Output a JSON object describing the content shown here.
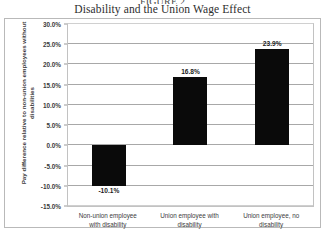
{
  "figure": {
    "caption_above": "FIGURE 2",
    "title": "Disability and the Union Wage Effect"
  },
  "chart_data": {
    "type": "bar",
    "title": "Disability and the Union Wage Effect",
    "xlabel": "",
    "ylabel": "Pay difference relative to non-union employees without disabilities",
    "categories": [
      "Non-union employee with disability",
      "Union employee with disability",
      "Union employee, no disability"
    ],
    "category_lines": [
      "Non-union employee\nwith disability",
      "Union employee with\ndisability",
      "Union employee, no\ndisability"
    ],
    "values": [
      -10.1,
      16.8,
      23.9
    ],
    "value_labels": [
      "-10.1%",
      "16.8%",
      "23.9%"
    ],
    "ylim": [
      -15.0,
      30.0
    ],
    "ytick_values": [
      30.0,
      25.0,
      20.0,
      15.0,
      10.0,
      5.0,
      0.0,
      -5.0,
      -10.0,
      -15.0
    ],
    "ytick_labels": [
      "30.0%",
      "25.0%",
      "20.0%",
      "15.0%",
      "10.0%",
      "5.0%",
      "0.0%",
      "-5.0%",
      "-10.0%",
      "-15.0%"
    ],
    "grid": "horizontal",
    "legend": "none",
    "bar_color": "#0a0a0a",
    "gridline_color": "#a8a8a8",
    "frame_color": "#b9b9b9"
  }
}
